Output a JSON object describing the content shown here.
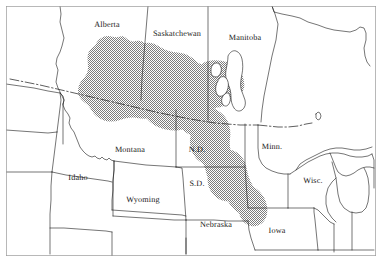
{
  "figure": {
    "frame_color": "#8a8a8a",
    "background_color": "#ffffff",
    "outline_color": "#1a1a1a",
    "shaded_region_color": "#9a9a9a",
    "shaded_region_name": "shaded-distribution-range",
    "international_border_style": "dash-dot"
  },
  "labels": {
    "provinces": [
      {
        "name": "alberta",
        "text": "Alberta",
        "x": 107,
        "y": 24,
        "size": "normal"
      },
      {
        "name": "saskatchewan",
        "text": "Saskatchewan",
        "x": 177,
        "y": 33,
        "size": "normal"
      },
      {
        "name": "manitoba",
        "text": "Manitoba",
        "x": 245,
        "y": 37,
        "size": "normal"
      }
    ],
    "states": [
      {
        "name": "montana",
        "text": "Montana",
        "x": 130,
        "y": 149,
        "size": "normal"
      },
      {
        "name": "idaho",
        "text": "Idaho",
        "x": 78,
        "y": 177,
        "size": "normal"
      },
      {
        "name": "wyoming",
        "text": "Wyoming",
        "x": 143,
        "y": 199,
        "size": "normal"
      },
      {
        "name": "north-dakota",
        "text": "N.D.",
        "x": 197,
        "y": 149,
        "size": "normal"
      },
      {
        "name": "south-dakota",
        "text": "S.D.",
        "x": 197,
        "y": 183,
        "size": "normal"
      },
      {
        "name": "nebraska",
        "text": "Nebraska",
        "x": 216,
        "y": 224,
        "size": "normal"
      },
      {
        "name": "minnesota",
        "text": "Minn.",
        "x": 272,
        "y": 146,
        "size": "normal"
      },
      {
        "name": "iowa",
        "text": "Iowa",
        "x": 277,
        "y": 230,
        "size": "normal"
      },
      {
        "name": "wisconsin",
        "text": "Wisc.",
        "x": 313,
        "y": 180,
        "size": "normal"
      }
    ]
  },
  "geography": {
    "water_bodies": [
      "Lake Winnipeg",
      "Lake Manitoba",
      "Lake Winnipegosis",
      "Lake Superior",
      "Lake Michigan"
    ],
    "unlabeled_states": [
      "British Columbia",
      "Washington",
      "Oregon",
      "Nevada",
      "Utah",
      "Colorado",
      "Kansas",
      "Missouri",
      "Illinois",
      "Michigan",
      "Ontario"
    ]
  }
}
